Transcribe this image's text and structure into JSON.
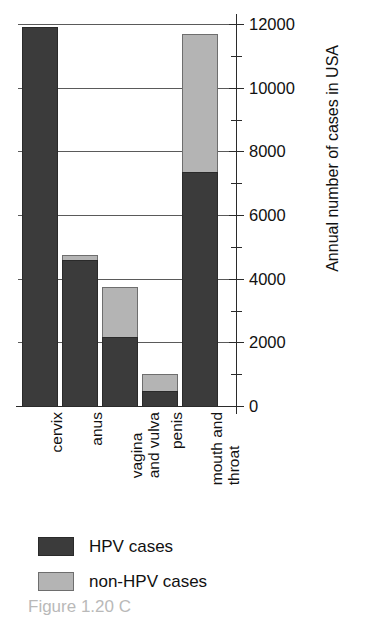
{
  "chart_data": {
    "type": "bar",
    "subtype": "stacked-vertical",
    "title": "",
    "xlabel": "",
    "ylabel": "Annual number of cases in USA",
    "ylim": [
      0,
      12000
    ],
    "ytick_step": 2000,
    "yminor_step": 1000,
    "grid": true,
    "grid_axis": "y",
    "legend_position": "bottom-left",
    "categories": [
      "cervix",
      "anus",
      "vagina and vulva",
      "penis",
      "mouth and throat"
    ],
    "category_label_lines": [
      [
        "cervix"
      ],
      [
        "anus"
      ],
      [
        "vagina",
        "and vulva"
      ],
      [
        "penis"
      ],
      [
        "mouth and",
        "throat"
      ]
    ],
    "series": [
      {
        "name": "HPV cases",
        "color": "#3b3b3b",
        "values": [
          11900,
          4600,
          2170,
          470,
          7350
        ]
      },
      {
        "name": "non-HPV cases",
        "color": "#b4b4b4",
        "values": [
          0,
          150,
          1580,
          530,
          4350
        ]
      }
    ],
    "totals": [
      11900,
      4750,
      3750,
      1000,
      11700
    ],
    "ytick_labels": [
      "0",
      "2000",
      "4000",
      "6000",
      "8000",
      "10000",
      "12000"
    ],
    "ytick_values": [
      0,
      2000,
      4000,
      6000,
      8000,
      10000,
      12000
    ],
    "yminor_values": [
      1000,
      3000,
      5000,
      7000,
      9000,
      11000
    ]
  },
  "axis": {
    "y_title": "Annual number of cases in USA"
  },
  "legend": {
    "items": [
      {
        "label": "HPV cases",
        "color": "#3b3b3b"
      },
      {
        "label": "non-HPV cases",
        "color": "#b4b4b4"
      }
    ]
  },
  "caption": {
    "text": "Figure 1.20 C"
  }
}
